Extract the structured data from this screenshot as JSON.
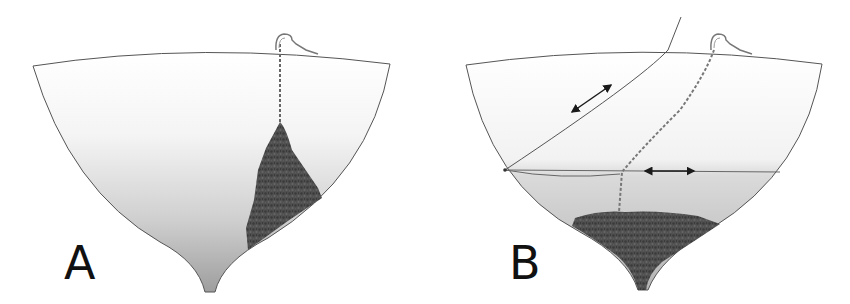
{
  "figure": {
    "type": "anchor chain locker diagram",
    "panels": [
      {
        "id": "A",
        "label": "A",
        "description": "Hull cross-section with anchor chain piled in a tall cone under the windlass on one side",
        "elements": [
          "hull-outline",
          "windlass",
          "chain",
          "chain-pile"
        ]
      },
      {
        "id": "B",
        "label": "B",
        "description": "Hull cross-section with chain led down to the keel, piled low and centered; rope rode and horizontal line with movement arrows",
        "elements": [
          "hull-outline",
          "windlass",
          "rope-rode",
          "chain",
          "horizontal-line",
          "arrow-diagonal",
          "arrow-horizontal",
          "chain-pile"
        ]
      }
    ],
    "colors": {
      "hull_line": "#555555",
      "hull_fill_top": "#ffffff",
      "hull_fill_bottom": "#a9a9a9",
      "chain_pile": "#4a4a4a",
      "arrow": "#1a1a1a",
      "label": "#111111"
    }
  }
}
